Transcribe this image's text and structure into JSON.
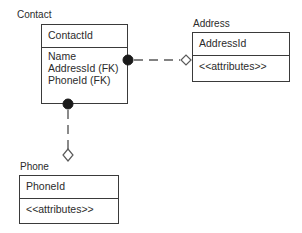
{
  "diagram": {
    "type": "entity-relationship",
    "notation": "crow-foot-diamond",
    "background_color": "#ffffff",
    "line_color": "#3a3a3a",
    "text_color": "#2b2b2b",
    "fill_color": "#ffffff"
  },
  "entities": [
    {
      "id": "contact",
      "label": "Contact",
      "key_attribute": "ContactId",
      "attributes": [
        "Name",
        "AddressId (FK)",
        "PhoneId (FK)"
      ]
    },
    {
      "id": "address",
      "label": "Address",
      "key_attribute": "AddressId",
      "attributes": [
        "<<attributes>>"
      ]
    },
    {
      "id": "phone",
      "label": "Phone",
      "key_attribute": "PhoneId",
      "attributes": [
        "<<attributes>>"
      ]
    }
  ],
  "relationships": [
    {
      "id": "contact-address",
      "from": "contact",
      "to": "address",
      "from_marker": "filled-circle",
      "to_marker": "hollow-diamond",
      "line_style": "dashed"
    },
    {
      "id": "contact-phone",
      "from": "contact",
      "to": "phone",
      "from_marker": "filled-circle",
      "to_marker": "hollow-diamond",
      "line_style": "dashed"
    }
  ]
}
